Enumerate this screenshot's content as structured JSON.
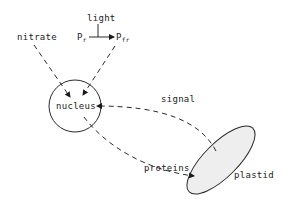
{
  "diagram": {
    "type": "biological pathway",
    "nodes": {
      "light": {
        "label": "light"
      },
      "pr": {
        "label": "P",
        "subscript": "r"
      },
      "pfr": {
        "label": "P",
        "subscript": "fr"
      },
      "nitrate": {
        "label": "nitrate"
      },
      "nucleus": {
        "label": "nucleus"
      },
      "plastid": {
        "label": "plastid"
      }
    },
    "edges": [
      {
        "from": "light",
        "to": "pr->pfr",
        "style": "solid",
        "meaning": "light drives conversion"
      },
      {
        "from": "pr",
        "to": "pfr",
        "style": "solid-arrow"
      },
      {
        "from": "nitrate",
        "to": "nucleus",
        "style": "dashed-arrow"
      },
      {
        "from": "pfr",
        "to": "nucleus",
        "style": "dashed-arrow"
      },
      {
        "from": "plastid",
        "to": "nucleus",
        "style": "dashed-arrow",
        "label": "signal"
      },
      {
        "from": "nucleus",
        "to": "plastid",
        "style": "dashed-arrow",
        "label": "proteins"
      }
    ],
    "edge_labels": {
      "signal": "signal",
      "proteins": "proteins"
    },
    "colors": {
      "stroke": "#2a2a2a",
      "plastid_fill": "#eeeeee",
      "background": "#ffffff"
    }
  }
}
